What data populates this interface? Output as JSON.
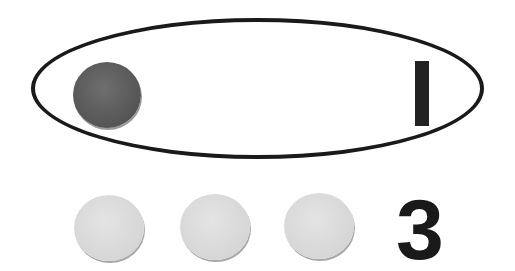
{
  "group": {
    "shape": "ellipse",
    "counters": [
      {
        "color": "#5c5c5c",
        "kind": "dark"
      }
    ],
    "numeral": "1"
  },
  "loose": {
    "counters": [
      {
        "color": "#d8d8d8",
        "kind": "light"
      },
      {
        "color": "#d8d8d8",
        "kind": "light"
      },
      {
        "color": "#d8d8d8",
        "kind": "light"
      }
    ],
    "numeral": "3"
  }
}
